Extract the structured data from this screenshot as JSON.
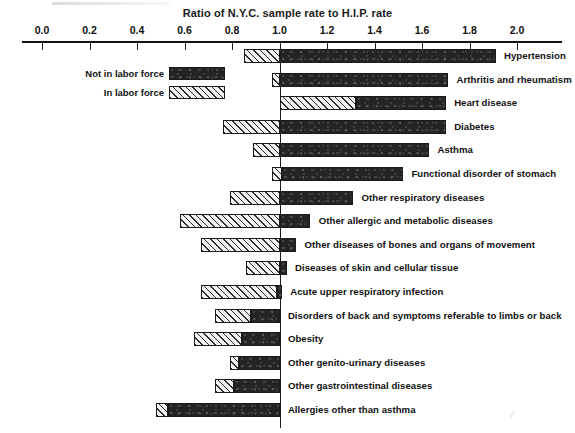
{
  "chart_data": {
    "type": "bar",
    "orientation": "horizontal",
    "title": "Ratio of N.Y.C. sample rate to H.I.P. rate",
    "xlabel": "",
    "ylabel": "",
    "xlim": [
      -0.02,
      2.12
    ],
    "reference_line": 1.0,
    "grid": false,
    "legend_position": "upper-left",
    "tick_labels": [
      "0.0",
      "0.2",
      "0.4",
      "0.6",
      "0.8",
      "1.0",
      "1.2",
      "1.4",
      "1.6",
      "1.8",
      "2.0"
    ],
    "tick_values": [
      0.0,
      0.2,
      0.4,
      0.6,
      0.8,
      1.0,
      1.2,
      1.4,
      1.6,
      1.8,
      2.0
    ],
    "legend": [
      {
        "name": "Not in labor force",
        "fill": "dark"
      },
      {
        "name": "In labor force",
        "fill": "hatched"
      }
    ],
    "categories": [
      "Hypertension",
      "Arthritis and rheumatism",
      "Heart disease",
      "Diabetes",
      "Asthma",
      "Functional disorder of stomach",
      "Other respiratory diseases",
      "Other allergic and metabolic diseases",
      "Other diseases of bones and organs of movement",
      "Diseases of skin and cellular tissue",
      "Acute upper respiratory infection",
      "Disorders of back and symptoms referable to limbs or back",
      "Obesity",
      "Other genito-urinary diseases",
      "Other gastrointestinal diseases",
      "Allergies other than asthma"
    ],
    "series": [
      {
        "name": "In labor force",
        "fill": "hatched",
        "spans": [
          [
            0.85,
            1.0
          ],
          [
            0.97,
            1.0
          ],
          [
            1.0,
            1.32
          ],
          [
            0.76,
            1.0
          ],
          [
            0.89,
            1.0
          ],
          [
            0.97,
            1.01
          ],
          [
            0.79,
            1.0
          ],
          [
            0.58,
            1.0
          ],
          [
            0.67,
            1.0
          ],
          [
            0.86,
            1.0
          ],
          [
            0.67,
            0.99
          ],
          [
            0.73,
            0.88
          ],
          [
            0.64,
            0.84
          ],
          [
            0.79,
            0.83
          ],
          [
            0.73,
            0.81
          ],
          [
            0.48,
            0.53
          ]
        ]
      },
      {
        "name": "Not in labor force",
        "fill": "dark",
        "spans": [
          [
            1.0,
            1.91
          ],
          [
            1.0,
            1.71
          ],
          [
            1.32,
            1.7
          ],
          [
            1.0,
            1.7
          ],
          [
            1.0,
            1.63
          ],
          [
            1.01,
            1.52
          ],
          [
            1.0,
            1.31
          ],
          [
            1.0,
            1.13
          ],
          [
            1.0,
            1.07
          ],
          [
            1.0,
            1.03
          ],
          [
            0.99,
            1.01
          ],
          [
            0.88,
            1.0
          ],
          [
            0.84,
            1.0
          ],
          [
            0.83,
            1.0
          ],
          [
            0.81,
            1.0
          ],
          [
            0.53,
            1.0
          ]
        ]
      }
    ],
    "label_x": [
      1.92,
      1.72,
      1.71,
      1.71,
      1.64,
      1.53,
      1.32,
      1.14,
      1.08,
      1.04,
      1.02,
      1.01,
      1.01,
      1.01,
      1.01,
      1.01
    ]
  },
  "decor": {
    "corner_mark": "⁄"
  }
}
